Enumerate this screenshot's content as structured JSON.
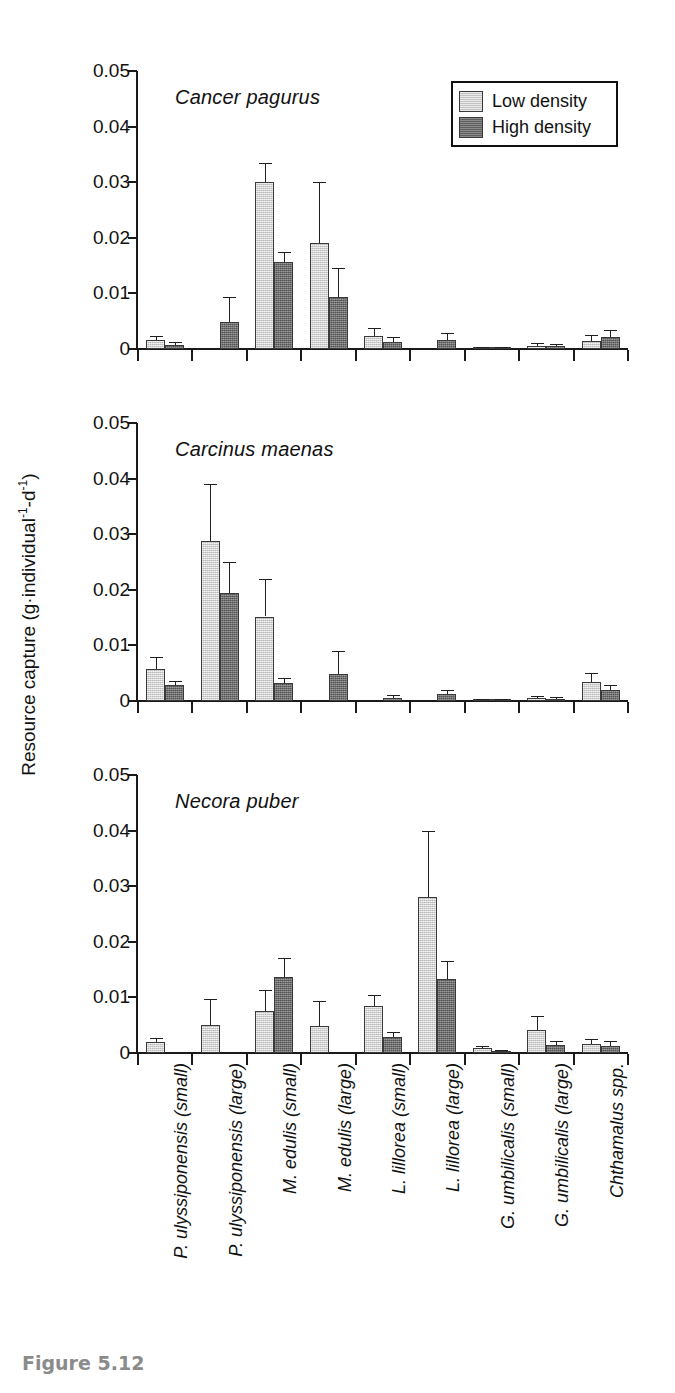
{
  "figure": {
    "caption": "Figure 5.12",
    "ylabel_text": "Resource capture (g·individual",
    "ylabel_sup1": "-1",
    "ylabel_mid": "-d",
    "ylabel_sup2": "-1",
    "ylabel_end": ")"
  },
  "legend": {
    "items": [
      {
        "label": "Low density",
        "swatch": "low-density-swatch",
        "color": "#d2d2d2"
      },
      {
        "label": "High density",
        "swatch": "high-density-swatch",
        "color": "#707070"
      }
    ]
  },
  "axis": {
    "yticks": [
      "0",
      "0.01",
      "0.02",
      "0.03",
      "0.04",
      "0.05"
    ],
    "ymin": 0,
    "ymax": 0.05
  },
  "chart_data": {
    "type": "bar",
    "xlabel": "",
    "ylabel": "Resource capture (g·individual-1-d-1)",
    "ylim": [
      0,
      0.05
    ],
    "yticks": [
      0,
      0.01,
      0.02,
      0.03,
      0.04,
      0.05
    ],
    "grid": false,
    "legend_position": "top-right",
    "error_bars": "standard error",
    "categories": [
      "P. ulyssiponensis (small)",
      "P. ulyssiponensis (large)",
      "M. edulis (small)",
      "M. edulis (large)",
      "L. lillorea (small)",
      "L. lillorea (large)",
      "G. umbilicalis (small)",
      "G. umbilicalis (large)",
      "Chthamalus spp."
    ],
    "panels": [
      {
        "name": "Cancer pagurus",
        "series": [
          {
            "name": "Low density",
            "color": "#d2d2d2",
            "values": [
              0.0016,
              0,
              0.03,
              0.019,
              0.0023,
              0,
              0.0002,
              0.0006,
              0.0015
            ],
            "errors": [
              0.0008,
              0,
              0.0034,
              0.011,
              0.0014,
              0,
              0.0001,
              0.0004,
              0.0011
            ]
          },
          {
            "name": "High density",
            "color": "#707070",
            "values": [
              0.0008,
              0.0048,
              0.0157,
              0.0094,
              0.0013,
              0.0017,
              0.0002,
              0.0005,
              0.0022
            ],
            "errors": [
              0.0005,
              0.0045,
              0.0018,
              0.0052,
              0.0008,
              0.0012,
              0.0001,
              0.0004,
              0.0012
            ]
          }
        ]
      },
      {
        "name": "Carcinus maenas",
        "series": [
          {
            "name": "Low density",
            "color": "#d2d2d2",
            "values": [
              0.0058,
              0.0288,
              0.0152,
              0,
              0,
              0,
              0.0002,
              0.0005,
              0.0035
            ],
            "errors": [
              0.0022,
              0.0102,
              0.0068,
              0,
              0,
              0,
              0.0001,
              0.0004,
              0.0016
            ]
          },
          {
            "name": "High density",
            "color": "#707070",
            "values": [
              0.0028,
              0.0194,
              0.0032,
              0.0048,
              0.0006,
              0.0012,
              0.0002,
              0.0004,
              0.002
            ],
            "errors": [
              0.0008,
              0.0056,
              0.001,
              0.0042,
              0.0004,
              0.0008,
              0.0001,
              0.0003,
              0.0008
            ]
          }
        ]
      },
      {
        "name": "Necora puber",
        "series": [
          {
            "name": "Low density",
            "color": "#d2d2d2",
            "values": [
              0.002,
              0.005,
              0.0076,
              0.0048,
              0.0085,
              0.0281,
              0.0009,
              0.0042,
              0.0016
            ],
            "errors": [
              0.0007,
              0.0047,
              0.0038,
              0.0045,
              0.0019,
              0.0119,
              0.0004,
              0.0024,
              0.001
            ]
          },
          {
            "name": "High density",
            "color": "#707070",
            "values": [
              0,
              0,
              0.0136,
              0,
              0.0029,
              0.0133,
              0.0004,
              0.0014,
              0.0012
            ],
            "errors": [
              0,
              0,
              0.0035,
              0,
              0.0008,
              0.0033,
              0.0002,
              0.0008,
              0.001
            ]
          }
        ]
      }
    ]
  }
}
